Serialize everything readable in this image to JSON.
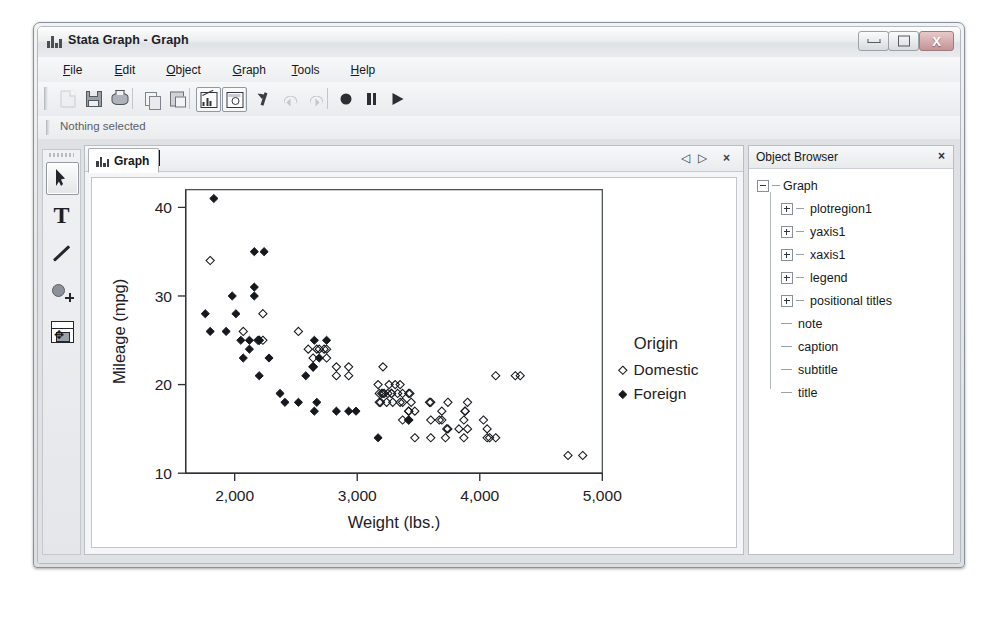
{
  "window": {
    "title": "Stata Graph - Graph",
    "icon": "bar-chart-icon",
    "controls": {
      "minimize": "–",
      "maximize": "□",
      "close": "X"
    }
  },
  "menu": [
    {
      "label": "File",
      "accel": "F"
    },
    {
      "label": "Edit",
      "accel": "E"
    },
    {
      "label": "Object",
      "accel": "O"
    },
    {
      "label": "Graph",
      "accel": "G"
    },
    {
      "label": "Tools",
      "accel": "T"
    },
    {
      "label": "Help",
      "accel": "H"
    }
  ],
  "toolbar": {
    "buttons": [
      {
        "name": "new-icon",
        "kind": "doc",
        "selected": false,
        "disabled": true
      },
      {
        "name": "save-icon",
        "kind": "save",
        "selected": false,
        "disabled": false
      },
      {
        "name": "print-icon",
        "kind": "print",
        "selected": false,
        "disabled": false
      },
      {
        "name": "copy-icon",
        "kind": "copy",
        "selected": false,
        "disabled": false
      },
      {
        "name": "paste-icon",
        "kind": "paste",
        "selected": false,
        "disabled": false
      },
      {
        "name": "grapheditor-icon",
        "kind": "chart",
        "selected": true,
        "disabled": false
      },
      {
        "name": "objectbrowser-icon",
        "kind": "insp",
        "selected": true,
        "disabled": false
      },
      {
        "name": "pin-icon",
        "kind": "pin",
        "selected": false,
        "disabled": false
      },
      {
        "name": "undo-icon",
        "kind": "undo",
        "selected": false,
        "disabled": true
      },
      {
        "name": "redo-icon",
        "kind": "redo",
        "selected": false,
        "disabled": true
      },
      {
        "name": "record-icon",
        "kind": "rec",
        "selected": false,
        "disabled": false
      },
      {
        "name": "pause-icon",
        "kind": "pause",
        "selected": false,
        "disabled": false
      },
      {
        "name": "play-icon",
        "kind": "play",
        "selected": false,
        "disabled": false
      }
    ]
  },
  "status": {
    "text": "Nothing selected"
  },
  "tools": [
    {
      "name": "pointer-tool",
      "selected": true
    },
    {
      "name": "text-tool",
      "selected": false,
      "glyph": "T"
    },
    {
      "name": "line-tool",
      "selected": false
    },
    {
      "name": "marker-tool",
      "selected": false
    },
    {
      "name": "grid-edit-tool",
      "selected": false,
      "glyph": "✥"
    }
  ],
  "tab": {
    "label": "Graph",
    "prev": "◁",
    "next": "▷",
    "close": "×"
  },
  "object_browser": {
    "title": "Object Browser",
    "close": "×",
    "tree": [
      {
        "label": "Graph",
        "level": 0,
        "expander": "minus"
      },
      {
        "label": "plotregion1",
        "level": 1,
        "expander": "plus"
      },
      {
        "label": "yaxis1",
        "level": 1,
        "expander": "plus"
      },
      {
        "label": "xaxis1",
        "level": 1,
        "expander": "plus"
      },
      {
        "label": "legend",
        "level": 1,
        "expander": "plus"
      },
      {
        "label": "positional titles",
        "level": 1,
        "expander": "plus"
      },
      {
        "label": "note",
        "level": 1,
        "expander": "leaf"
      },
      {
        "label": "caption",
        "level": 1,
        "expander": "leaf"
      },
      {
        "label": "subtitle",
        "level": 1,
        "expander": "leaf"
      },
      {
        "label": "title",
        "level": 1,
        "expander": "leaf"
      }
    ]
  },
  "chart_data": {
    "type": "scatter",
    "title": "",
    "xlabel": "Weight (lbs.)",
    "ylabel": "Mileage (mpg)",
    "xlim": [
      1600,
      5000
    ],
    "ylim": [
      10,
      42
    ],
    "xticks": [
      2000,
      3000,
      4000,
      5000
    ],
    "xticklabels": [
      "2,000",
      "3,000",
      "4,000",
      "5,000"
    ],
    "yticks": [
      10,
      20,
      30,
      40
    ],
    "yticklabels": [
      "10",
      "20",
      "30",
      "40"
    ],
    "grid": false,
    "legend": {
      "title": "Origin",
      "position": "right",
      "entries": [
        {
          "name": "Domestic",
          "marker": "hollow-diamond"
        },
        {
          "name": "Foreign",
          "marker": "filled-diamond"
        }
      ]
    },
    "series": [
      {
        "name": "Domestic",
        "marker": "hollow-diamond",
        "points": [
          [
            4720,
            12
          ],
          [
            4840,
            12
          ],
          [
            4330,
            21
          ],
          [
            3900,
            18
          ],
          [
            3870,
            16
          ],
          [
            4130,
            21
          ],
          [
            4060,
            14
          ],
          [
            4130,
            14
          ],
          [
            3720,
            14
          ],
          [
            3830,
            15
          ],
          [
            4060,
            15
          ],
          [
            3600,
            18
          ],
          [
            3330,
            19
          ],
          [
            3370,
            19
          ],
          [
            3280,
            19
          ],
          [
            3880,
            17
          ],
          [
            3670,
            16
          ],
          [
            4030,
            16
          ],
          [
            3350,
            20
          ],
          [
            3420,
            19
          ],
          [
            3690,
            16
          ],
          [
            3180,
            18
          ],
          [
            3220,
            19
          ],
          [
            3430,
            19
          ],
          [
            3260,
            20
          ],
          [
            3690,
            17
          ],
          [
            3440,
            18
          ],
          [
            3250,
            19
          ],
          [
            3470,
            17
          ],
          [
            3590,
            18
          ],
          [
            3280,
            19
          ],
          [
            3210,
            22
          ],
          [
            3200,
            19
          ],
          [
            3740,
            18
          ],
          [
            3880,
            17
          ],
          [
            2930,
            21
          ],
          [
            2640,
            22
          ],
          [
            2830,
            22
          ],
          [
            2690,
            24
          ],
          [
            2730,
            24
          ],
          [
            2670,
            24
          ],
          [
            2600,
            24
          ],
          [
            2750,
            24
          ],
          [
            3470,
            14
          ],
          [
            3190,
            18
          ],
          [
            2230,
            25
          ],
          [
            2190,
            25
          ],
          [
            2200,
            25
          ],
          [
            2070,
            26
          ],
          [
            2640,
            23
          ],
          [
            2520,
            26
          ],
          [
            3420,
            17
          ],
          [
            3240,
            18
          ],
          [
            3290,
            18
          ],
          [
            3370,
            16
          ],
          [
            3730,
            15
          ],
          [
            2830,
            21
          ],
          [
            2230,
            28
          ],
          [
            1800,
            34
          ],
          [
            3310,
            20
          ],
          [
            3420,
            16
          ],
          [
            3600,
            14
          ],
          [
            4080,
            14
          ],
          [
            3900,
            15
          ],
          [
            2640,
            22
          ],
          [
            3180,
            19
          ],
          [
            2750,
            23
          ],
          [
            3350,
            18
          ],
          [
            3420,
            17
          ],
          [
            2930,
            22
          ],
          [
            3870,
            14
          ],
          [
            4290,
            21
          ],
          [
            3170,
            20
          ],
          [
            3370,
            18
          ],
          [
            3210,
            19
          ],
          [
            3600,
            16
          ],
          [
            3740,
            15
          ]
        ]
      },
      {
        "name": "Foreign",
        "marker": "filled-diamond",
        "points": [
          [
            2640,
            22
          ],
          [
            2830,
            17
          ],
          [
            2070,
            23
          ],
          [
            1760,
            28
          ],
          [
            2050,
            25
          ],
          [
            2280,
            23
          ],
          [
            2200,
            25
          ],
          [
            2750,
            25
          ],
          [
            2120,
            25
          ],
          [
            1980,
            30
          ],
          [
            2160,
            31
          ],
          [
            2670,
            18
          ],
          [
            2240,
            35
          ],
          [
            2520,
            18
          ],
          [
            2160,
            35
          ],
          [
            2370,
            19
          ],
          [
            1830,
            41
          ],
          [
            2010,
            28
          ],
          [
            2160,
            30
          ],
          [
            2650,
            17
          ],
          [
            2410,
            18
          ],
          [
            3170,
            14
          ],
          [
            2580,
            21
          ],
          [
            2930,
            17
          ],
          [
            2650,
            25
          ],
          [
            2200,
            21
          ],
          [
            1930,
            26
          ],
          [
            1800,
            26
          ],
          [
            2690,
            23
          ],
          [
            2990,
            17
          ],
          [
            2120,
            24
          ],
          [
            3420,
            16
          ]
        ]
      }
    ]
  }
}
